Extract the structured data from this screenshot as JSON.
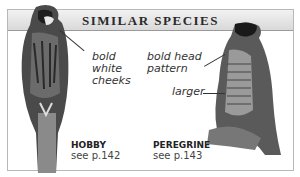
{
  "header": {
    "title": "SIMILAR SPECIES"
  },
  "species": [
    {
      "name": "HOBBY",
      "ref": "see p.142",
      "labels": [
        "bold",
        "white",
        "cheeks"
      ]
    },
    {
      "name": "PEREGRINE",
      "ref": "see p.143",
      "labels": [
        "bold head",
        "pattern",
        "larger"
      ]
    }
  ]
}
